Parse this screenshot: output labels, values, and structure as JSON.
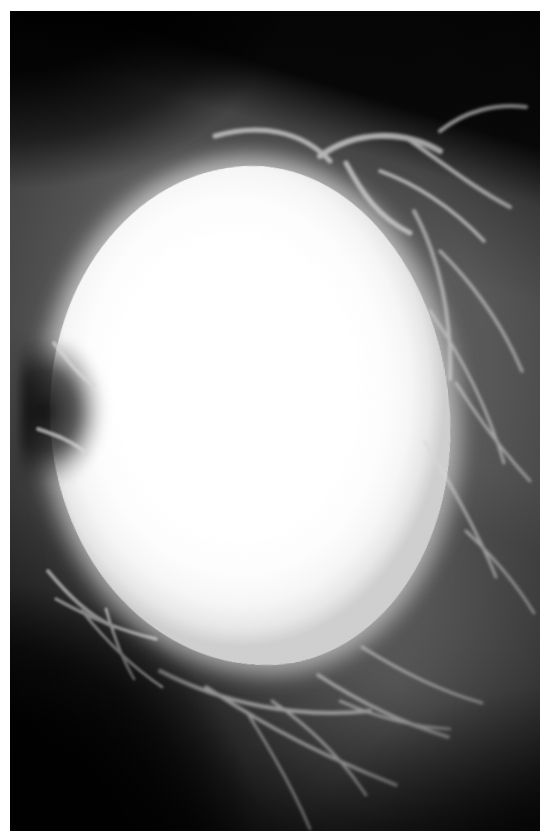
{
  "image": {
    "kind": "radiograph",
    "modality_label": "Mammogram",
    "view_label": "Mediolateral oblique",
    "orientation_label": "Right breast",
    "colorspace": "grayscale",
    "width_px": 558,
    "height_px": 834,
    "border": {
      "paper_color": "#ffffff",
      "left_px": 10,
      "top_px": 11,
      "right_px": 18,
      "bottom_px": 3
    },
    "overlay_text": [],
    "annotations": [],
    "regions": [
      {
        "name": "background-air",
        "label": "Unexposed background",
        "tone": "#060606",
        "position": "upper-left and lower-left corners"
      },
      {
        "name": "pectoral-tissue-wedge",
        "label": "Surrounding breast parenchyma",
        "tone": "#6e6e6e",
        "position": "upper-right diagonal band"
      },
      {
        "name": "dominant-mass",
        "label": "Large well-circumscribed radiodense mass",
        "tone": "#ffffff",
        "position": "centre",
        "center_x_px": 240,
        "center_y_px": 405,
        "width_px": 400,
        "height_px": 500,
        "margin_description": "smooth, rounded, sharply defined"
      },
      {
        "name": "glandular-haze",
        "label": "Inferior glandular tissue",
        "tone": "#7a7a7a",
        "position": "lower-right"
      },
      {
        "name": "trabecular-strands",
        "label": "Fibrous trabecular strands",
        "tone": "#d8d8d8",
        "position": "perimeter of mass"
      }
    ],
    "colors": {
      "film_black": "#0a0a0a",
      "tissue_mid_gray": "#6e6e6e",
      "mass_white": "#ffffff",
      "strand_gray": "#d8d8d8",
      "paper_white": "#ffffff"
    }
  }
}
